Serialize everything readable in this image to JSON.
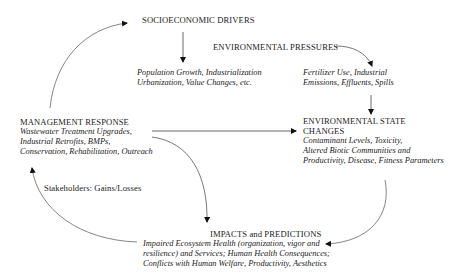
{
  "nodes": {
    "socioeconomic": {
      "title": "SOCIOECONOMIC  DRIVERS"
    },
    "drivers_desc": {
      "lines": [
        "Population Growth, Industrialization",
        "Urbanization, Value Changes, etc."
      ]
    },
    "pressures": {
      "title": "ENVIRONMENTAL  PRESSURES"
    },
    "pressures_desc": {
      "lines": [
        "Fertilizer Use, Industrial",
        "Emissions, Effluents, Spills"
      ]
    },
    "state_changes": {
      "title_lines": [
        "ENVIRONMENTAL STATE",
        "CHANGES"
      ],
      "lines": [
        "Contaminant Levels, Toxicity,",
        "Altered Biotic Communities and",
        "Productivity, Disease, Fitness Parameters"
      ]
    },
    "management": {
      "title": "MANAGEMENT RESPONSE",
      "lines": [
        "Wastewater Treatment Upgrades,",
        "Industrial Retrofits, BMPs,",
        "Conservation, Rehabilitation, Outreach"
      ]
    },
    "stakeholders": {
      "label": "Stakeholders: Gains/Losses"
    },
    "impacts": {
      "title": "IMPACTS and PREDICTIONS",
      "lines": [
        "Impaired Ecosystem Health (organization, vigor and",
        "resilience) and Services; Human Health Consequences;",
        "Conflicts with Human Welfare, Productivity, Aesthetics"
      ]
    }
  },
  "colors": {
    "text": "#222222",
    "arrow": "#555555",
    "arrowhead": "#111111",
    "background": "#ffffff"
  }
}
